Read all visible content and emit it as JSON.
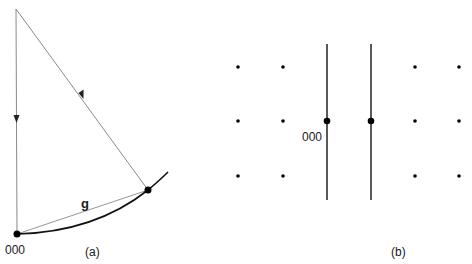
{
  "panel_a": {
    "caption": "(a)",
    "origin_label": "000",
    "vector_label": "g",
    "colors": {
      "ray": "#8a8a8a",
      "sphere": "#111111",
      "point": "#000000"
    }
  },
  "panel_b": {
    "caption": "(b)",
    "origin_label": "000",
    "dot_rows_y": [
      67,
      121,
      176
    ],
    "dot_cols_x": [
      238,
      283,
      415,
      459
    ],
    "line_x": [
      327,
      371
    ]
  }
}
